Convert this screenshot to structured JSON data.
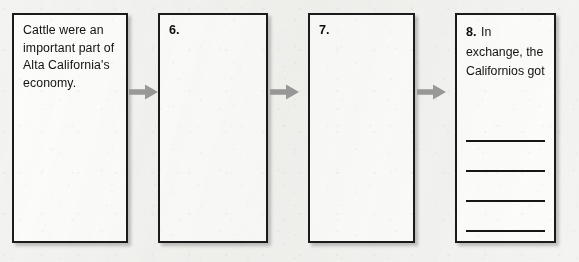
{
  "document": {
    "type": "worksheet-flow-chart",
    "background_color": "#f3f3f1",
    "box_border_color": "#1b1b1b",
    "box_fill_color": "#fcfcfb",
    "arrow_color": "#9a9a9a",
    "text_color": "#121212"
  },
  "flow": {
    "boxes": [
      {
        "id": "box-1",
        "number": "",
        "text": "Cattle were an important part of Alta California's economy.",
        "has_answer_lines": false,
        "answer_line_count": 0
      },
      {
        "id": "box-2",
        "number": "6.",
        "text": "",
        "has_answer_lines": false,
        "answer_line_count": 0
      },
      {
        "id": "box-3",
        "number": "7.",
        "text": "",
        "has_answer_lines": false,
        "answer_line_count": 0
      },
      {
        "id": "box-4",
        "number": "8.",
        "text": "In exchange, the Californios got",
        "has_answer_lines": true,
        "answer_line_count": 4
      }
    ],
    "arrows": [
      {
        "id": "arrow-1",
        "from": "box-1",
        "to": "box-2",
        "icon": "arrow-right-icon"
      },
      {
        "id": "arrow-2",
        "from": "box-2",
        "to": "box-3",
        "icon": "arrow-right-icon"
      },
      {
        "id": "arrow-3",
        "from": "box-3",
        "to": "box-4",
        "icon": "arrow-right-icon"
      }
    ]
  }
}
